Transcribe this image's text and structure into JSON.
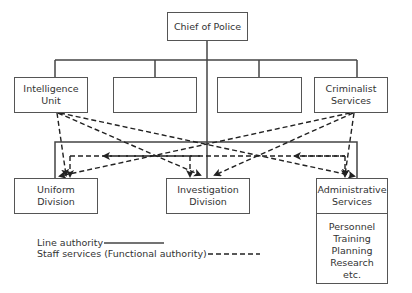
{
  "diagram": {
    "chief": {
      "label": "Chief of Police"
    },
    "top_row": [
      {
        "line1": "Intelligence",
        "line2": "Unit"
      },
      {
        "line1": "",
        "line2": ""
      },
      {
        "line1": "",
        "line2": ""
      },
      {
        "line1": "Criminalist",
        "line2": "Services"
      }
    ],
    "bottom_row": {
      "uniform": {
        "line1": "Uniform",
        "line2": "Division"
      },
      "investigation": {
        "line1": "Investigation",
        "line2": "Division"
      },
      "administrative": {
        "line1": "Administrative",
        "line2": "Services",
        "functions": [
          "Personnel",
          "Training",
          "Planning",
          "Research",
          "etc."
        ]
      }
    },
    "legend": {
      "line_authority": "Line authority",
      "staff_services": "Staff services (Functional authority)"
    },
    "colors": {
      "line": "#444444",
      "box_border": "#555555",
      "text": "#333333"
    }
  }
}
